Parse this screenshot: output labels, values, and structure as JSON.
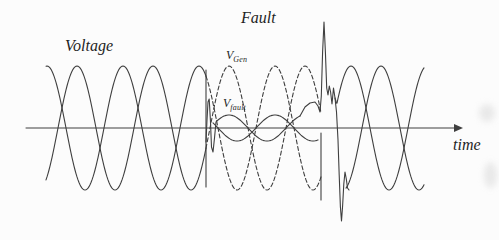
{
  "figure": {
    "title_labels": {
      "voltage": "Voltage",
      "fault": "Fault",
      "time": "time",
      "v_gen": {
        "main": "V",
        "sub": "Gen"
      },
      "v_fault": {
        "main": "V",
        "sub": "fault"
      }
    },
    "colors": {
      "stroke": "#3f3f3f",
      "text": "#1f1f1f",
      "background": "#fcfcfc"
    },
    "axis": {
      "y": 128,
      "x_start": 26,
      "x_end": 455,
      "arrow_tip_x": 463,
      "arrow_half_height": 4
    },
    "waveform": {
      "period": 76,
      "amplitude": 62,
      "fault_amplitude": 13,
      "center_y": 128,
      "x_ref": 58,
      "waves": [
        {
          "name": "phase-a",
          "sign": -1,
          "shift": 0
        },
        {
          "name": "phase-b",
          "sign": 1,
          "shift": 8
        }
      ],
      "segments": [
        {
          "name": "pre-fault-wave-a",
          "wave": 0,
          "x0": 46,
          "x1": 206,
          "amp": "full",
          "dashed": false
        },
        {
          "name": "pre-fault-wave-b",
          "wave": 1,
          "x0": 46,
          "x1": 206,
          "amp": "full",
          "dashed": false
        },
        {
          "name": "vgen-dashed-wave-a",
          "wave": 0,
          "x0": 206,
          "x1": 321,
          "amp": "full",
          "dashed": true
        },
        {
          "name": "vgen-dashed-wave-b",
          "wave": 1,
          "x0": 206,
          "x1": 321,
          "amp": "full",
          "dashed": true
        },
        {
          "name": "vfault-wave-a",
          "wave": 0,
          "x0": 217,
          "x1": 300,
          "amp": "fault",
          "dashed": false
        },
        {
          "name": "vfault-wave-b",
          "wave": 1,
          "x0": 213,
          "x1": 318,
          "amp": "fault",
          "dashed": false
        },
        {
          "name": "post-fault-wave-a",
          "wave": 0,
          "x0": 346,
          "x1": 424,
          "amp": "full",
          "dashed": false
        },
        {
          "name": "post-fault-wave-b",
          "wave": 1,
          "x0": 337,
          "x1": 424,
          "amp": "full",
          "dashed": false
        }
      ],
      "polylines": [
        {
          "name": "fault-onset-collapse-line",
          "points": [
            [
              206,
              70
            ],
            [
              206,
              187
            ]
          ]
        },
        {
          "name": "fault-clear-collapse-line",
          "points": [
            [
              321,
              133
            ],
            [
              321,
              200
            ]
          ]
        },
        {
          "name": "fault-onset-transient",
          "points": [
            [
              206,
              142
            ],
            [
              207,
              120
            ],
            [
              208,
              102
            ],
            [
              209.2,
              99
            ],
            [
              210.4,
              120
            ],
            [
              211.5,
              147
            ],
            [
              213,
              152
            ],
            [
              214.5,
              138
            ],
            [
              216,
              122
            ],
            [
              217,
              120.5
            ]
          ]
        },
        {
          "name": "fault-clear-spike",
          "points": [
            [
              300,
              116
            ],
            [
              305,
              107
            ],
            [
              310,
              103
            ],
            [
              315,
              102
            ],
            [
              318,
              106
            ],
            [
              320,
              112
            ],
            [
              321.3,
              96
            ],
            [
              322.6,
              52
            ],
            [
              324,
              22
            ],
            [
              325.4,
              52
            ],
            [
              326.7,
              88
            ],
            [
              328,
              95
            ],
            [
              329.3,
              86
            ],
            [
              330.6,
              92
            ],
            [
              332,
              104
            ],
            [
              333.5,
              88
            ],
            [
              335,
              98
            ],
            [
              336.5,
              103
            ]
          ]
        },
        {
          "name": "fault-clear-recovery",
          "points": [
            [
              335,
              98
            ],
            [
              336.5,
              112
            ],
            [
              338,
              140
            ],
            [
              339.2,
              175
            ],
            [
              340.4,
              207
            ],
            [
              341.5,
              221
            ],
            [
              342.6,
              206
            ],
            [
              343.8,
              184
            ],
            [
              345,
              172
            ],
            [
              346.3,
              179
            ],
            [
              347.5,
              188
            ],
            [
              349,
              190
            ]
          ]
        }
      ]
    }
  }
}
